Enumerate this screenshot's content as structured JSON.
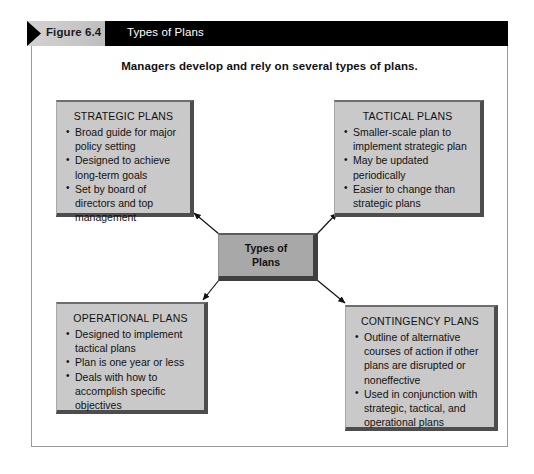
{
  "header": {
    "figure_label": "Figure 6.4",
    "title": "Types of Plans"
  },
  "subtitle": "Managers develop and rely on several types of plans.",
  "center": {
    "label": "Types of\nPlans"
  },
  "boxes": [
    {
      "id": "strategic",
      "title": "STRATEGIC PLANS",
      "items": [
        "Broad guide for major policy setting",
        "Designed to achieve long-term goals",
        "Set by board of directors and top management"
      ]
    },
    {
      "id": "tactical",
      "title": "TACTICAL PLANS",
      "items": [
        "Smaller-scale plan to implement strategic plan",
        "May be updated periodically",
        "Easier to change than strategic plans"
      ]
    },
    {
      "id": "operational",
      "title": "OPERATIONAL PLANS",
      "items": [
        "Designed to implement tactical plans",
        "Plan is one year or less",
        "Deals with how to accomplish specific objectives"
      ]
    },
    {
      "id": "contingency",
      "title": "CONTINGENCY PLANS",
      "items": [
        "Outline of alternative courses of action if other plans are disrupted or noneffective",
        "Used in conjunction with strategic, tactical, and operational plans"
      ]
    }
  ],
  "colors": {
    "header_bar": "#000000",
    "figure_tab": "#c6c6c6",
    "box_fill": "#c9c9c9",
    "center_fill": "#a8a8a8",
    "box_shadow": "#4d4d4d",
    "frame_border": "#9a9a9a",
    "connector": "#111111"
  }
}
